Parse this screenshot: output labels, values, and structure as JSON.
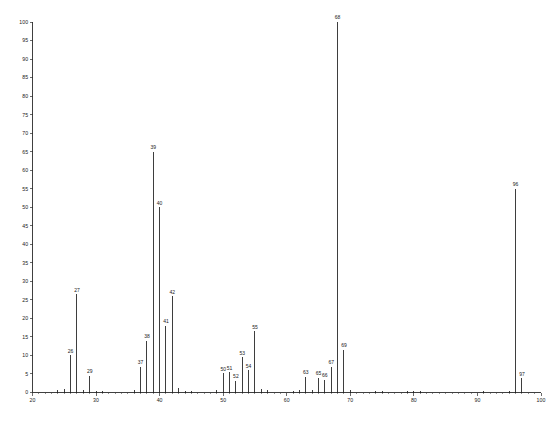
{
  "chart_data": {
    "type": "bar",
    "title": "",
    "subtitle": "",
    "xlabel": "",
    "ylabel": "",
    "xlim": [
      20,
      100
    ],
    "ylim": [
      0,
      100
    ],
    "grid": false,
    "legend": null,
    "x_ticks": [
      20,
      30,
      40,
      50,
      60,
      70,
      80,
      90,
      100
    ],
    "x_tick_labels": [
      "20",
      "30",
      "40",
      "50",
      "60",
      "70",
      "80",
      "90",
      "100"
    ],
    "x_minor_tick_step": 1,
    "y_ticks": [
      0,
      5,
      10,
      15,
      20,
      25,
      30,
      35,
      40,
      45,
      50,
      55,
      60,
      65,
      70,
      75,
      80,
      85,
      90,
      95,
      100
    ],
    "y_tick_labels": [
      "0",
      "5",
      "10",
      "15",
      "20",
      "25",
      "30",
      "35",
      "40",
      "45",
      "50",
      "55",
      "60",
      "65",
      "70",
      "75",
      "80",
      "85",
      "90",
      "95",
      "100"
    ],
    "base_peak_mz": 68,
    "categories": [
      24,
      25,
      26,
      27,
      28,
      29,
      30,
      31,
      36,
      37,
      38,
      39,
      40,
      41,
      42,
      43,
      44,
      45,
      49,
      50,
      51,
      52,
      53,
      54,
      55,
      56,
      57,
      61,
      62,
      63,
      64,
      65,
      66,
      67,
      68,
      69,
      70,
      74,
      75,
      79,
      80,
      81,
      91,
      95,
      96,
      97
    ],
    "values": [
      0.7,
      0.9,
      10.0,
      26.5,
      0.6,
      4.5,
      0.5,
      0.4,
      0.6,
      7.0,
      14.0,
      65.0,
      50.0,
      18.0,
      26.0,
      1.2,
      0.5,
      0.4,
      0.8,
      5.2,
      5.5,
      3.2,
      9.5,
      6.0,
      16.5,
      1.0,
      0.6,
      0.5,
      0.8,
      4.2,
      0.8,
      4.0,
      3.5,
      7.0,
      100.0,
      11.5,
      0.7,
      0.4,
      0.4,
      0.4,
      0.5,
      0.4,
      0.4,
      0.4,
      55.0,
      3.8
    ],
    "labeled_peaks": [
      {
        "mz": 26,
        "intensity": 10.0,
        "label": "26"
      },
      {
        "mz": 27,
        "intensity": 26.5,
        "label": "27"
      },
      {
        "mz": 29,
        "intensity": 4.5,
        "label": "29"
      },
      {
        "mz": 37,
        "intensity": 7.0,
        "label": "37"
      },
      {
        "mz": 38,
        "intensity": 14.0,
        "label": "38"
      },
      {
        "mz": 39,
        "intensity": 65.0,
        "label": "39"
      },
      {
        "mz": 40,
        "intensity": 50.0,
        "label": "40"
      },
      {
        "mz": 41,
        "intensity": 18.0,
        "label": "41"
      },
      {
        "mz": 42,
        "intensity": 26.0,
        "label": "42"
      },
      {
        "mz": 50,
        "intensity": 5.2,
        "label": "50"
      },
      {
        "mz": 51,
        "intensity": 5.5,
        "label": "51"
      },
      {
        "mz": 52,
        "intensity": 3.2,
        "label": "52"
      },
      {
        "mz": 53,
        "intensity": 9.5,
        "label": "53"
      },
      {
        "mz": 54,
        "intensity": 6.0,
        "label": "54"
      },
      {
        "mz": 55,
        "intensity": 16.5,
        "label": "55"
      },
      {
        "mz": 63,
        "intensity": 4.2,
        "label": "63"
      },
      {
        "mz": 65,
        "intensity": 4.0,
        "label": "65"
      },
      {
        "mz": 66,
        "intensity": 3.5,
        "label": "66"
      },
      {
        "mz": 67,
        "intensity": 7.0,
        "label": "67"
      },
      {
        "mz": 68,
        "intensity": 100.0,
        "label": "68"
      },
      {
        "mz": 69,
        "intensity": 11.5,
        "label": "69"
      },
      {
        "mz": 96,
        "intensity": 55.0,
        "label": "96"
      },
      {
        "mz": 97,
        "intensity": 3.8,
        "label": "97"
      }
    ]
  },
  "caption": {
    "text": ""
  }
}
